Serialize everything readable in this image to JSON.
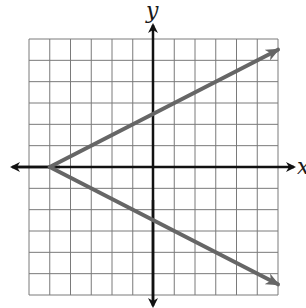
{
  "chart_data": {
    "type": "line",
    "title": "",
    "xlabel": "x",
    "ylabel": "y",
    "xlim": [
      -6,
      6
    ],
    "ylim": [
      -6,
      6
    ],
    "grid": true,
    "grid_step": 1,
    "tick_labels": false,
    "legend": null,
    "equation_hint": "x = 2|y| - 5",
    "series": [
      {
        "name": "upper-ray",
        "points": [
          [
            -5,
            0
          ],
          [
            6,
            5.5
          ]
        ],
        "arrow_at_end": true,
        "color": "#666666"
      },
      {
        "name": "lower-ray",
        "points": [
          [
            -5,
            0
          ],
          [
            6,
            -5.5
          ]
        ],
        "arrow_at_end": true,
        "color": "#666666"
      }
    ],
    "vertex": [
      -5,
      0
    ]
  },
  "labels": {
    "x_axis": "x",
    "y_axis": "y"
  },
  "colors": {
    "grid": "#7a7a7a",
    "axes": "#111111",
    "rays": "#666666",
    "background": "#ffffff"
  }
}
